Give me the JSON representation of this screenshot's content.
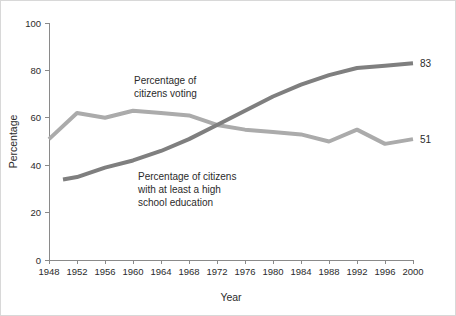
{
  "chart_data": {
    "type": "line",
    "title": "",
    "xlabel": "Year",
    "ylabel": "Percentage",
    "xlim": [
      1948,
      2000
    ],
    "ylim": [
      0,
      100
    ],
    "grid": false,
    "legend": "inline-annotations",
    "x_ticks": [
      1948,
      1952,
      1956,
      1960,
      1964,
      1968,
      1972,
      1976,
      1980,
      1984,
      1988,
      1992,
      1996,
      2000
    ],
    "y_ticks": [
      0,
      20,
      40,
      60,
      80,
      100
    ],
    "x": [
      1948,
      1952,
      1956,
      1960,
      1964,
      1968,
      1972,
      1976,
      1980,
      1984,
      1988,
      1992,
      1996,
      2000
    ],
    "series": [
      {
        "name": "Percentage of citizens voting",
        "color": "#ababab",
        "stroke_width": 4,
        "end_label": "51",
        "values": [
          51,
          62,
          60,
          63,
          62,
          61,
          57,
          55,
          54,
          53,
          50,
          55,
          49,
          51
        ]
      },
      {
        "name": "Percentage of citizens with at least a high school education",
        "color": "#7f7f7f",
        "stroke_width": 4,
        "end_label": "83",
        "values": [
          33,
          35,
          39,
          42,
          46,
          51,
          57,
          63,
          69,
          74,
          78,
          81,
          82,
          83
        ],
        "starts_at": 1950,
        "start_value": 34
      }
    ],
    "annotations": [
      {
        "id": "voting-annotation",
        "lines": [
          "Percentage of",
          "citizens voting"
        ],
        "x_px": 133,
        "y_px": 83
      },
      {
        "id": "education-annotation",
        "lines": [
          "Percentage of citizens",
          "with at least a high",
          "school education"
        ],
        "x_px": 137,
        "y_px": 179
      }
    ]
  }
}
